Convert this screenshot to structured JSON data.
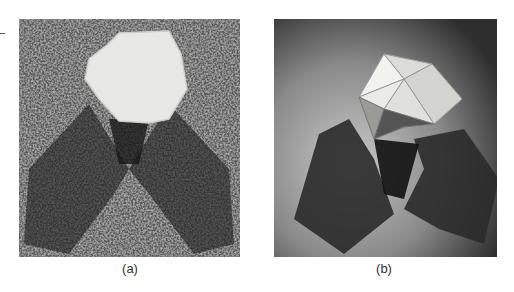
{
  "figure": {
    "panels": [
      {
        "id": "a",
        "label": "(a)",
        "description": "micrograph of shadowed polyhedral virus particle on textured background"
      },
      {
        "id": "b",
        "label": "(b)",
        "description": "photograph of shadowed icosahedral model casting two shadows"
      }
    ]
  }
}
